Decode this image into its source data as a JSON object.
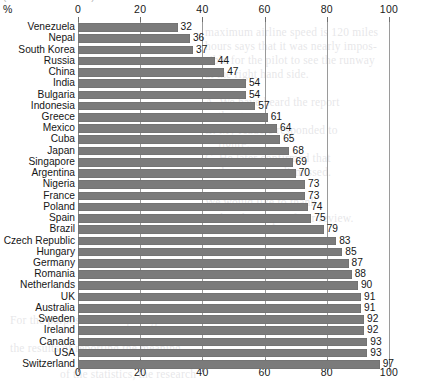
{
  "chart_title_partial": "(Source: OECD/ITU)",
  "axis": {
    "unit_label": "%",
    "ticks": [
      0,
      20,
      40,
      60,
      80,
      100
    ],
    "xlim": [
      0,
      100
    ]
  },
  "chart_data": {
    "type": "bar",
    "orientation": "horizontal",
    "title": "",
    "xlabel": "%",
    "ylabel": "",
    "xlim": [
      0,
      100
    ],
    "grid": true,
    "legend": "none",
    "data_labels": true,
    "bar_color": "#7b7b7b",
    "categories": [
      "Venezuela",
      "Nepal",
      "South Korea",
      "Russia",
      "China",
      "India",
      "Bulgaria",
      "Indonesia",
      "Greece",
      "Mexico",
      "Cuba",
      "Japan",
      "Singapore",
      "Argentina",
      "Nigeria",
      "France",
      "Poland",
      "Spain",
      "Brazil",
      "Czech Republic",
      "Hungary",
      "Germany",
      "Romania",
      "Netherlands",
      "UK",
      "Australia",
      "Sweden",
      "Ireland",
      "Canada",
      "USA",
      "Switzerland"
    ],
    "values": [
      32,
      36,
      37,
      44,
      47,
      54,
      54,
      57,
      61,
      64,
      65,
      68,
      69,
      70,
      73,
      73,
      74,
      75,
      79,
      83,
      85,
      87,
      88,
      90,
      91,
      91,
      92,
      92,
      93,
      93,
      97
    ]
  },
  "ghost_text": [
    {
      "x": 205,
      "y": 26,
      "text": "maximum airline speed is 120 miles"
    },
    {
      "x": 205,
      "y": 40,
      "text": "hours says that it was nearly impos-"
    },
    {
      "x": 205,
      "y": 54,
      "text": "sible for the pilot to see the runway"
    },
    {
      "x": 205,
      "y": 68,
      "text": "at the right hand side."
    },
    {
      "x": 205,
      "y": 96,
      "text": "A. We have heard the report"
    },
    {
      "x": 218,
      "y": 110,
      "text": "the storm."
    },
    {
      "x": 205,
      "y": 124,
      "text": "B. My readers responded to"
    },
    {
      "x": 218,
      "y": 138,
      "text": "figure."
    },
    {
      "x": 205,
      "y": 152,
      "text": "C. He later confirmed that"
    },
    {
      "x": 218,
      "y": 166,
      "text": "the case was dismissed."
    },
    {
      "x": 205,
      "y": 196,
      "text": "We would like to thank"
    },
    {
      "x": 205,
      "y": 212,
      "text": "within the scope of our review."
    },
    {
      "x": 10,
      "y": 314,
      "text": "For the purposes of comparing"
    },
    {
      "x": 10,
      "y": 342,
      "text": "the results of reporting the meaning"
    },
    {
      "x": 60,
      "y": 368,
      "text": "of the statistics, the research"
    }
  ]
}
